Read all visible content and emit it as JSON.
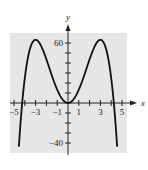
{
  "chart_data": {
    "type": "line",
    "title": "",
    "xlabel": "x",
    "ylabel": "y",
    "xlim": [
      -5.5,
      6
    ],
    "ylim": [
      -45,
      75
    ],
    "x_ticks": [
      -5,
      -4,
      -3,
      -2,
      -1,
      0,
      1,
      2,
      3,
      4,
      5
    ],
    "x_tick_labels": [
      {
        "v": -5,
        "t": "−5"
      },
      {
        "v": -3,
        "t": "−3"
      },
      {
        "v": -1,
        "t": "−1"
      },
      {
        "v": 1,
        "t": "1"
      },
      {
        "v": 3,
        "t": "3"
      },
      {
        "v": 5,
        "t": "5"
      }
    ],
    "y_ticks": [
      -40,
      -30,
      -20,
      -10,
      10,
      20,
      30,
      40,
      50,
      60
    ],
    "y_tick_labels": [
      {
        "v": 60,
        "t": "60"
      },
      {
        "v": -40,
        "t": "−40"
      }
    ],
    "series": [
      {
        "name": "f(x) = 0.78(18x² − x⁴)",
        "x": [
          -4.6,
          -4.24,
          -4,
          -3.5,
          -3,
          -2.5,
          -2,
          -1.5,
          -1,
          -0.5,
          0,
          0.5,
          1,
          1.5,
          2,
          2.5,
          3,
          3.5,
          4,
          4.24,
          4.6
        ],
        "y": [
          -52.9,
          0,
          24.96,
          48.98,
          63.18,
          57.3,
          43.68,
          27.65,
          13.26,
          3.46,
          0,
          3.46,
          13.26,
          27.65,
          43.68,
          57.3,
          63.18,
          48.98,
          24.96,
          0,
          -52.9
        ]
      }
    ],
    "grid": false,
    "background": "#e6e6e6"
  }
}
